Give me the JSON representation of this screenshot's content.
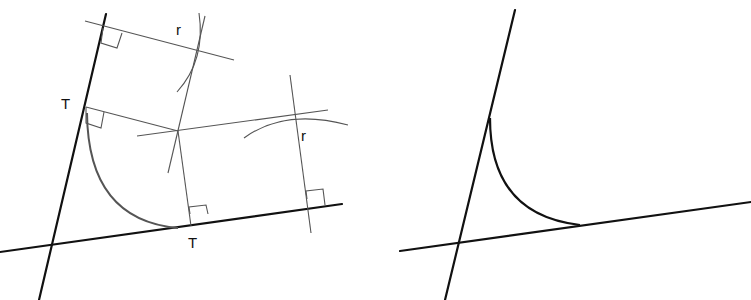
{
  "left_diagram": {
    "title": "Construction of arc tangent to two lines",
    "labels": {
      "tangent_point_left": "T",
      "tangent_point_bottom": "T",
      "radius_top": "r",
      "radius_right": "r"
    }
  },
  "right_diagram": {
    "title": "Resulting fillet arc between two lines"
  }
}
